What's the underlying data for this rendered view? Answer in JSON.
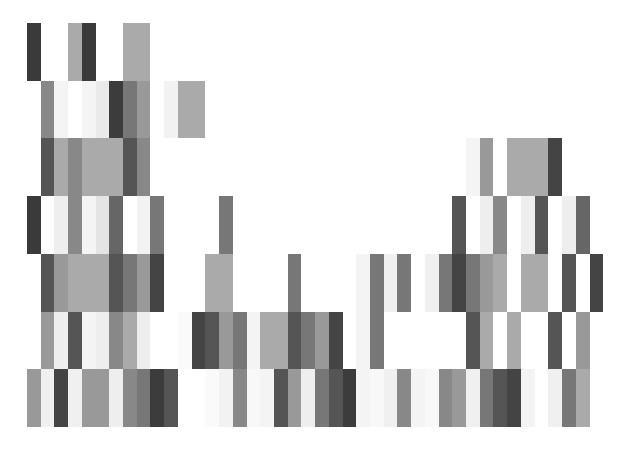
{
  "pattern": {
    "origin_x": 27,
    "origin_y": 23,
    "cell_width": 13.72,
    "cell_height": 57.7,
    "columns": 42,
    "background": "#ffffff",
    "rows": [
      [
        "#3a3a3a",
        "",
        "",
        "#aaaaaa",
        "#3a3a3a",
        "",
        "",
        "#aaaaaa",
        "#aaaaaa",
        "",
        "",
        "",
        "",
        "",
        "",
        "",
        "",
        "",
        "",
        "",
        "",
        "",
        "",
        "",
        "",
        "",
        "",
        "",
        "",
        "",
        "",
        "",
        "",
        "",
        "",
        "",
        "",
        "",
        "",
        "",
        "",
        ""
      ],
      [
        "",
        "#888888",
        "#f4f4f4",
        "",
        "#f4f4f4",
        "#eaeaea",
        "#3c3c3c",
        "#777777",
        "#999999",
        "",
        "#f2f2f2",
        "#aaaaaa",
        "#aaaaaa",
        "",
        "",
        "",
        "",
        "",
        "",
        "",
        "",
        "",
        "",
        "",
        "",
        "",
        "",
        "",
        "",
        "",
        "",
        "",
        "",
        "",
        "",
        "",
        "",
        "",
        "",
        "",
        "",
        ""
      ],
      [
        "",
        "#555555",
        "#aaaaaa",
        "#888888",
        "#aaaaaa",
        "#aaaaaa",
        "#aaaaaa",
        "#555555",
        "#888888",
        "",
        "",
        "",
        "",
        "",
        "",
        "",
        "",
        "",
        "",
        "",
        "",
        "",
        "",
        "",
        "",
        "",
        "",
        "",
        "",
        "",
        "",
        "",
        "#f4f4f4",
        "#999999",
        "",
        "#aaaaaa",
        "#aaaaaa",
        "#aaaaaa",
        "#444444",
        "",
        "",
        ""
      ],
      [
        "#3a3a3a",
        "",
        "#eeeeee",
        "#888888",
        "#f4f4f4",
        "#e4e4e4",
        "#666666",
        "",
        "#f2f2f2",
        "#777777",
        "",
        "",
        "",
        "",
        "#777777",
        "",
        "",
        "",
        "",
        "",
        "",
        "",
        "",
        "",
        "",
        "",
        "",
        "",
        "",
        "",
        "",
        "#555555",
        "",
        "#eeeeee",
        "#888888",
        "",
        "#eeeeee",
        "#555555",
        "",
        "#eeeeee",
        "#666666",
        ""
      ],
      [
        "",
        "#555555",
        "#999999",
        "#aaaaaa",
        "#aaaaaa",
        "#aaaaaa",
        "#555555",
        "#777777",
        "#999999",
        "#444444",
        "",
        "",
        "",
        "#aaaaaa",
        "#aaaaaa",
        "",
        "",
        "",
        "",
        "#777777",
        "",
        "",
        "",
        "",
        "#f4f4f4",
        "#777777",
        "#f0f0f0",
        "#777777",
        "",
        "#f0f0f0",
        "#777777",
        "#444444",
        "#777777",
        "#999999",
        "#aaaaaa",
        "",
        "#aaaaaa",
        "#aaaaaa",
        "",
        "#555555",
        "",
        "#444444"
      ],
      [
        "",
        "#999999",
        "#eeeeee",
        "#555555",
        "#f4f4f4",
        "#eeeeee",
        "#888888",
        "#aaaaaa",
        "#eeeeee",
        "",
        "",
        "#fafafa",
        "#444444",
        "#555555",
        "#999999",
        "#777777",
        "#f4f4f4",
        "#aaaaaa",
        "#aaaaaa",
        "#555555",
        "#777777",
        "#999999",
        "#444444",
        "",
        "#f4f4f4",
        "#777777",
        "",
        "",
        "",
        "",
        "",
        "",
        "#555555",
        "#aaaaaa",
        "",
        "#aaaaaa",
        "",
        "",
        "#555555",
        "",
        "#999999",
        ""
      ],
      [
        "#999999",
        "#f0f0f0",
        "#444444",
        "#f0f0f0",
        "#999999",
        "#999999",
        "#eeeeee",
        "#888888",
        "#777777",
        "#3c3c3c",
        "#555555",
        "",
        "",
        "#fafafa",
        "#f2f2f2",
        "#888888",
        "#f8f8f8",
        "#f4f4f4",
        "#555555",
        "#999999",
        "#eeeeee",
        "#777777",
        "#555555",
        "#3c3c3c",
        "#f4f4f4",
        "#f8f8f8",
        "#f0f0f0",
        "#888888",
        "#f4f4f4",
        "#f8f8f8",
        "#888888",
        "#999999",
        "#f0f0f0",
        "#777777",
        "#555555",
        "#444444",
        "#f4f4f4",
        "",
        "#f0f0f0",
        "#777777",
        "#aaaaaa",
        ""
      ]
    ]
  }
}
